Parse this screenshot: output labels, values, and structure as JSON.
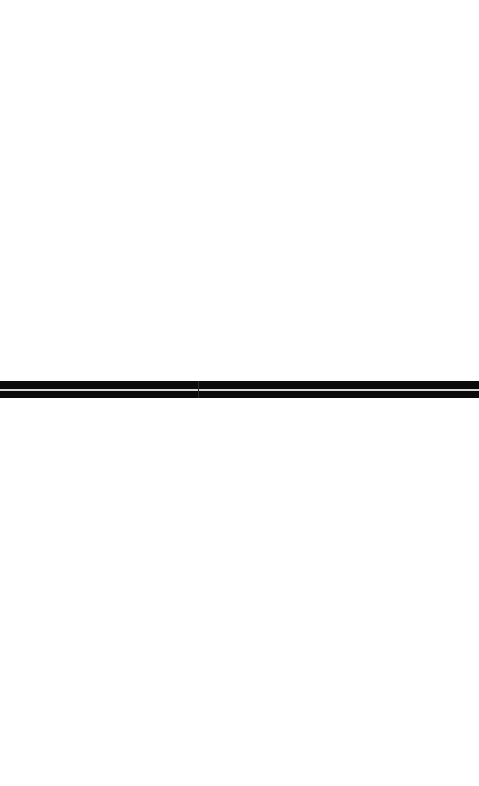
{
  "page": {
    "background": "#ffffff"
  },
  "splitter": {
    "orientation": "horizontal",
    "color": "#0a0a0a",
    "gap_color": "#d8d8d8",
    "top_px": 381,
    "height_px": 17
  },
  "panes": {
    "top": {
      "content": ""
    },
    "bottom": {
      "content": ""
    }
  }
}
